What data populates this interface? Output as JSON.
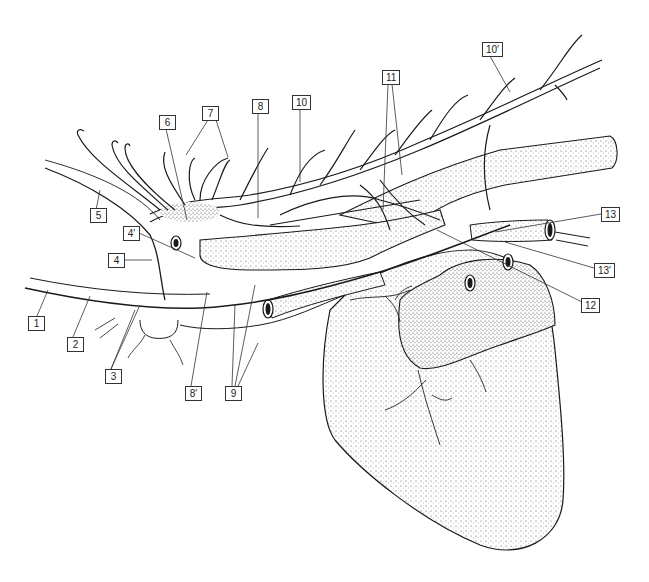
{
  "figure": {
    "type": "anatomical line drawing",
    "colors": {
      "line": "#1a1a1a",
      "stipple": "#555555",
      "background": "#ffffff",
      "label_border": "#333333"
    }
  },
  "labels": [
    {
      "id": "1",
      "text": "1",
      "x": 28,
      "y": 323
    },
    {
      "id": "2",
      "text": "2",
      "x": 67,
      "y": 337
    },
    {
      "id": "3",
      "text": "3",
      "x": 105,
      "y": 369
    },
    {
      "id": "4",
      "text": "4",
      "x": 108,
      "y": 253
    },
    {
      "id": "4p",
      "text": "4′",
      "x": 123,
      "y": 226
    },
    {
      "id": "5",
      "text": "5",
      "x": 90,
      "y": 210
    },
    {
      "id": "6",
      "text": "6",
      "x": 159,
      "y": 115
    },
    {
      "id": "7",
      "text": "7",
      "x": 202,
      "y": 106
    },
    {
      "id": "8",
      "text": "8",
      "x": 252,
      "y": 99
    },
    {
      "id": "8p",
      "text": "8′",
      "x": 185,
      "y": 386
    },
    {
      "id": "9",
      "text": "9",
      "x": 225,
      "y": 386
    },
    {
      "id": "10",
      "text": "10",
      "x": 292,
      "y": 95
    },
    {
      "id": "10p",
      "text": "10′",
      "x": 482,
      "y": 42
    },
    {
      "id": "11",
      "text": "11",
      "x": 382,
      "y": 70
    },
    {
      "id": "12",
      "text": "12",
      "x": 581,
      "y": 298
    },
    {
      "id": "13",
      "text": "13",
      "x": 601,
      "y": 207
    },
    {
      "id": "13p",
      "text": "13′",
      "x": 594,
      "y": 263
    }
  ]
}
